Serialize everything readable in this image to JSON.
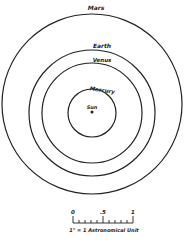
{
  "diagram": {
    "center_label": "Sun",
    "orbits": [
      {
        "name": "Mercury",
        "radius_au": 0.39
      },
      {
        "name": "Venus",
        "radius_au": 0.72
      },
      {
        "name": "Earth",
        "radius_au": 1.0
      },
      {
        "name": "Mars",
        "radius_au": 1.52
      }
    ],
    "scale_bar": {
      "ticks": [
        "0",
        ".5",
        "1"
      ],
      "caption": "1\" = 1 Astronomical Unit"
    }
  }
}
